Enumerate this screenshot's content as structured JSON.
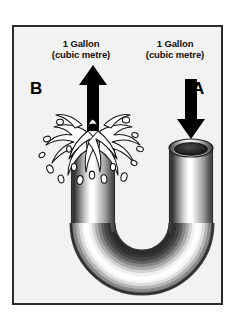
{
  "figure": {
    "title": "U-tube flow diagram: one gallon in at A, one gallon out at B",
    "background_color": "#ffffff",
    "panel_background_color": "#f2f2f2",
    "panel_border_color": "#2b2b2b"
  },
  "captions": {
    "left": {
      "line1": "1 Gallon",
      "line2": "(cubic metre)"
    },
    "right": {
      "line1": "1 Gallon",
      "line2": "(cubic metre)"
    }
  },
  "ports": {
    "outlet": {
      "letter": "B",
      "arrow_direction": "up",
      "arrow_color": "#000000"
    },
    "inlet": {
      "letter": "A",
      "arrow_direction": "down",
      "arrow_color": "#000000"
    }
  },
  "pipe": {
    "shape": "u-tube",
    "material": "metallic",
    "highlight_color": "#ffffff",
    "shadow_color": "#2e2e2e",
    "midtone_color": "#9a9a9a",
    "bore_color": "#1a1a1a"
  },
  "splash": {
    "location": "left-outlet",
    "fill_color": "#ffffff",
    "outline_color": "#111111",
    "droplet_count": 16
  },
  "icons": {
    "arrow_up": "arrow-up-icon",
    "arrow_down": "arrow-down-icon",
    "splash": "water-splash-icon",
    "pipe_opening": "pipe-opening-icon"
  }
}
